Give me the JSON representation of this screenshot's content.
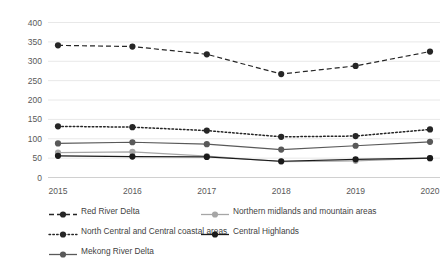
{
  "chart_data": {
    "type": "line",
    "title": "",
    "subtitle": "",
    "xlabel": "",
    "ylabel": "",
    "categories": [
      "2015",
      "2016",
      "2017",
      "2018",
      "2019",
      "2020"
    ],
    "ylim": [
      0,
      400
    ],
    "yticks": [
      0,
      50,
      100,
      150,
      200,
      250,
      300,
      350,
      400
    ],
    "ytick_labels": [
      "0",
      "50",
      "100",
      "150",
      "200",
      "250",
      "300",
      "350",
      "400"
    ],
    "grid": true,
    "grid_axis": "y",
    "legend_position": "bottom",
    "series": [
      {
        "name": "Red River Delta",
        "values": [
          341,
          338,
          318,
          267,
          288,
          325
        ],
        "line_style": "dashed",
        "color": "#262626",
        "marker": "circle"
      },
      {
        "name": "Northern midlands and mountain areas",
        "values": [
          64,
          66,
          55,
          41,
          43,
          50
        ],
        "line_style": "solid",
        "color": "#a6a6a6",
        "marker": "circle"
      },
      {
        "name": "North Central and Central coastal areas",
        "values": [
          132,
          130,
          121,
          105,
          107,
          124
        ],
        "line_style": "dotted",
        "color": "#262626",
        "marker": "circle"
      },
      {
        "name": "Central Highlands",
        "values": [
          56,
          54,
          53,
          42,
          47,
          50
        ],
        "line_style": "solid",
        "color": "#1a1a1a",
        "marker": "circle"
      },
      {
        "name": "Mekong River Delta",
        "values": [
          88,
          91,
          86,
          72,
          82,
          92
        ],
        "line_style": "solid",
        "color": "#595959",
        "marker": "circle"
      }
    ]
  },
  "legend": {
    "rows": [
      [
        {
          "label": "Red River Delta",
          "style": "dashed",
          "color": "#262626"
        },
        {
          "label": "Northern midlands and mountain areas",
          "style": "solid",
          "color": "#a6a6a6"
        }
      ],
      [
        {
          "label": "North Central and Central coastal areas",
          "style": "dotted",
          "color": "#262626"
        },
        {
          "label": "Central Highlands",
          "style": "solid",
          "color": "#1a1a1a"
        }
      ],
      [
        {
          "label": "Mekong River Delta",
          "style": "solid",
          "color": "#595959"
        }
      ]
    ]
  }
}
